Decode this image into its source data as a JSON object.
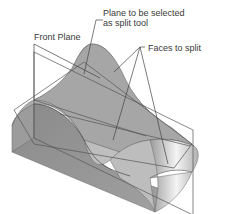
{
  "figure": {
    "callouts": {
      "split_tool": {
        "line1": "Plane to be selected",
        "line2": "as split tool"
      },
      "front_plane": "Front Plane",
      "faces": "Faces to split"
    },
    "colors": {
      "background": "#ffffff",
      "solid_dark": "#8c8c8c",
      "solid_mid": "#a8a8a8",
      "solid_light": "#d4d4d4",
      "highlight": "#f2f2f2",
      "edge": "#555555",
      "leader": "#444444",
      "text": "#3a3a3a"
    }
  }
}
